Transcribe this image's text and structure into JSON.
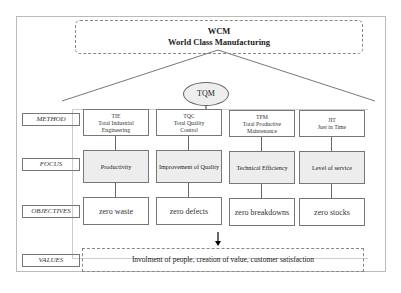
{
  "header": {
    "title": "WCM",
    "subtitle": "World Class Manufacturing"
  },
  "center": {
    "label": "TQM"
  },
  "row_labels": {
    "method": "METHOD",
    "focus": "FOCUS",
    "objectives": "OBJECTIVES",
    "values": "VALUES"
  },
  "columns": [
    {
      "abbr": "TIE",
      "name1": "Total Industrial",
      "name2": "Engineering",
      "focus": "Productivity",
      "objective": "zero waste"
    },
    {
      "abbr": "TQC",
      "name1": "Total Quality",
      "name2": "Control",
      "focus": "Improvement of Quality",
      "objective": "zero defects"
    },
    {
      "abbr": "TPM",
      "name1": "Total Productive",
      "name2": "Maintenance",
      "focus": "Technical Efficiency",
      "objective": "zero breakdowns"
    },
    {
      "abbr": "JIT",
      "name1": "Just in Time",
      "name2": "",
      "focus": "Level of service",
      "objective": "zero stocks"
    }
  ],
  "values_text": "Involment of people, creation of value, customer satisfaction"
}
